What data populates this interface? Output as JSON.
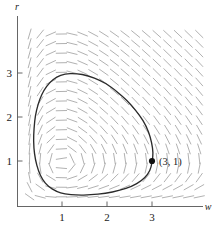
{
  "chart_data": {
    "type": "line",
    "title": "",
    "subtitle": "",
    "xlabel": "w",
    "ylabel": "r",
    "xlim": [
      0,
      4.2
    ],
    "ylim": [
      0,
      4.1
    ],
    "grid": false,
    "legend": "none",
    "annotations": [
      {
        "name": "initial-condition",
        "label": "(3, 1)",
        "x": 3,
        "y": 1,
        "marker": "filled-circle"
      }
    ],
    "xticks": [
      1,
      2,
      3
    ],
    "xtick_labels": [
      "1",
      "2",
      "3"
    ],
    "yticks": [
      1,
      2,
      3
    ],
    "ytick_labels": [
      "1",
      "2",
      "3"
    ],
    "series": [
      {
        "name": "closed-orbit",
        "type": "closed-curve",
        "color": "#2b2b2b",
        "points": [
          [
            3.0,
            1.0
          ],
          [
            3.02,
            1.22
          ],
          [
            2.99,
            1.45
          ],
          [
            2.92,
            1.7
          ],
          [
            2.8,
            1.95
          ],
          [
            2.64,
            2.18
          ],
          [
            2.44,
            2.41
          ],
          [
            2.22,
            2.61
          ],
          [
            1.98,
            2.79
          ],
          [
            1.72,
            2.92
          ],
          [
            1.45,
            3.0
          ],
          [
            1.18,
            3.02
          ],
          [
            0.97,
            2.98
          ],
          [
            0.8,
            2.88
          ],
          [
            0.66,
            2.73
          ],
          [
            0.55,
            2.54
          ],
          [
            0.47,
            2.32
          ],
          [
            0.41,
            2.06
          ],
          [
            0.38,
            1.78
          ],
          [
            0.37,
            1.49
          ],
          [
            0.39,
            1.2
          ],
          [
            0.44,
            0.94
          ],
          [
            0.52,
            0.71
          ],
          [
            0.63,
            0.53
          ],
          [
            0.78,
            0.4
          ],
          [
            0.97,
            0.31
          ],
          [
            1.2,
            0.27
          ],
          [
            1.48,
            0.26
          ],
          [
            1.8,
            0.28
          ],
          [
            2.12,
            0.33
          ],
          [
            2.42,
            0.41
          ],
          [
            2.66,
            0.52
          ],
          [
            2.84,
            0.66
          ],
          [
            2.95,
            0.82
          ],
          [
            3.0,
            1.0
          ]
        ]
      }
    ],
    "vector_field": {
      "name": "direction-field",
      "color": "#a8a8a8",
      "description": "counterclockwise rotation about center (1,1)",
      "center": [
        1,
        1
      ],
      "grid_nx": 17,
      "grid_ny": 18,
      "system": "Lotka-Volterra"
    }
  },
  "axes": {
    "x_name": "w",
    "y_name": "r"
  }
}
